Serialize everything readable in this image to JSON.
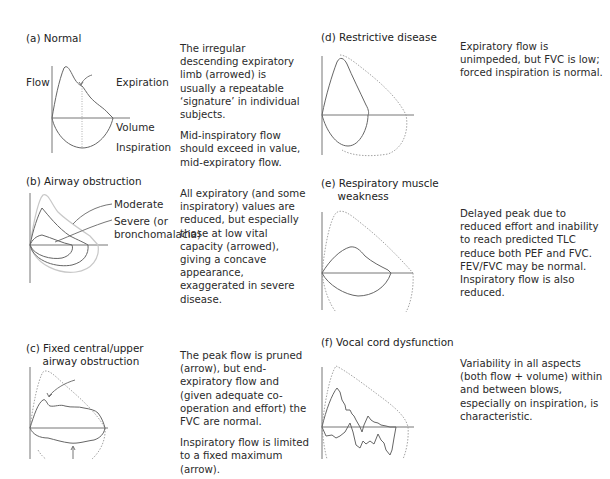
{
  "panels": [
    {
      "id": "a",
      "title": "(a) Normal",
      "labels": {
        "flow": "Flow",
        "expiration": "Expiration",
        "volume": "Volume",
        "inspiration": "Inspiration"
      },
      "description": [
        "The irregular descending expiratory limb (arrowed) is usually a repeatable ‘signature’ in individual subjects.",
        "Mid-inspiratory flow should exceed in value, mid-expiratory flow."
      ]
    },
    {
      "id": "b",
      "title": "(b) Airway obstruction",
      "labels": {
        "moderate": "Moderate",
        "severe": "Severe (or",
        "severe_2": "bronchomalacia)"
      },
      "description": [
        "All expiratory (and some inspiratory) values are reduced, but especially those at low vital capacity (arrowed), giving a concave appearance, exaggerated in severe disease."
      ]
    },
    {
      "id": "c",
      "title": "(c) Fixed central/upper\n     airway obstruction",
      "description": [
        "The peak flow is pruned (arrow), but end-expiratory flow and (given adequate co-operation and effort) the FVC are normal.",
        "Inspiratory flow is limited to a fixed maximum (arrow)."
      ]
    },
    {
      "id": "d",
      "title": "(d) Restrictive disease",
      "description": [
        "Expiratory flow is unimpeded, but FVC is low; forced inspiration is normal."
      ]
    },
    {
      "id": "e",
      "title": "(e) Respiratory muscle\n     weakness",
      "description": [
        "Delayed peak due to reduced effort and inability to reach predicted TLC reduce both PEF and FVC. FEV/FVC may be normal. Inspiratory flow is also reduced."
      ]
    },
    {
      "id": "f",
      "title": "(f) Vocal cord dysfunction",
      "description": [
        "Variability in all aspects (both flow + volume) within and between blows, especially on inspiration, is characteristic."
      ]
    }
  ],
  "colors": {
    "curve": "#666666",
    "axis": "#777777",
    "reference_dotted": "#999999",
    "text": "#2a2a2a"
  }
}
